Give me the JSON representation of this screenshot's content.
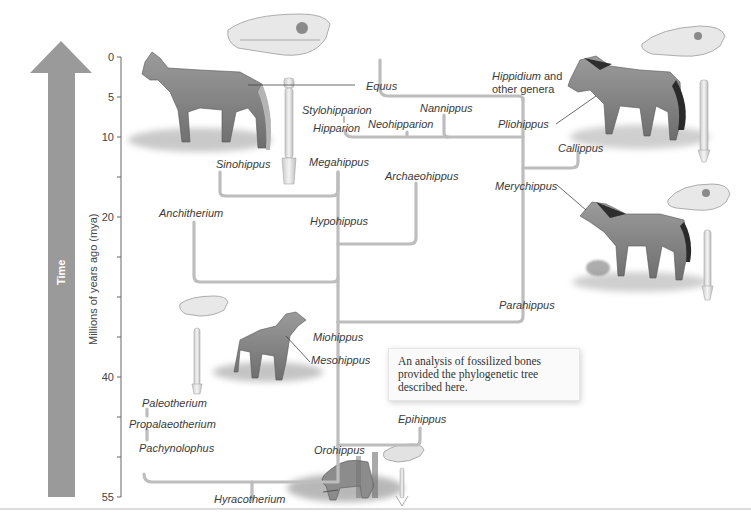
{
  "figure": {
    "time_arrow_label": "Time",
    "axis_title": "Millions of years ago (mya)",
    "axis": {
      "min": 0,
      "max": 55,
      "direction": "down",
      "labeled_ticks": [
        "0",
        "5",
        "10",
        "20",
        "40",
        "55"
      ],
      "tick_values_all": [
        0,
        5,
        10,
        15,
        20,
        25,
        30,
        35,
        40,
        45,
        50,
        55
      ]
    },
    "note": "An analysis of fossilized bones provided the phylogenetic tree described here.",
    "taxa": {
      "equus": "Equus",
      "hippidium": "Hippidium",
      "hippidium_suffix": " and",
      "other_genera": "other genera",
      "stylohipparion": "Stylohipparion",
      "hipparion": "Hipparion",
      "neohipparion": "Neohipparion",
      "nannippus": "Nannippus",
      "pliohippus": "Pliohippus",
      "callippus": "Callippus",
      "sinohippus": "Sinohippus",
      "megahippus": "Megahippus",
      "archaeohippus": "Archaeohippus",
      "merychippus": "Merychippus",
      "anchitherium": "Anchitherium",
      "hypohippus": "Hypohippus",
      "parahippus": "Parahippus",
      "miohippus": "Miohippus",
      "mesohippus": "Mesohippus",
      "paleotherium": "Paleotherium",
      "propalaeotherium": "Propalaeotherium",
      "pachynolophus": "Pachynolophus",
      "epihippus": "Epihippus",
      "orohippus": "Orohippus",
      "hyracotherium": "Hyracotherium"
    },
    "illustrations": [
      {
        "name": "equus-horse",
        "label": "Equus"
      },
      {
        "name": "equus-skull"
      },
      {
        "name": "equus-leg-bone"
      },
      {
        "name": "pliohippus-horse",
        "label": "Pliohippus"
      },
      {
        "name": "pliohippus-skull"
      },
      {
        "name": "pliohippus-leg-bone"
      },
      {
        "name": "merychippus-horse",
        "label": "Merychippus"
      },
      {
        "name": "merychippus-skull"
      },
      {
        "name": "merychippus-leg-bone"
      },
      {
        "name": "mesohippus-horse",
        "label": "Mesohippus"
      },
      {
        "name": "mesohippus-skull"
      },
      {
        "name": "mesohippus-leg-bone"
      },
      {
        "name": "hyracotherium-animal",
        "label": "Hyracotherium"
      },
      {
        "name": "hyracotherium-skull"
      },
      {
        "name": "hyracotherium-leg-bone"
      }
    ],
    "colors": {
      "arrow": "#9a9a9a",
      "branch": "#bdbdbd",
      "axis": "#666666",
      "text": "#3a3a3a"
    }
  }
}
